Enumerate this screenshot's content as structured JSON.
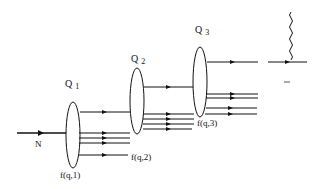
{
  "diagram": {
    "input": {
      "label": "N"
    },
    "stages": [
      {
        "name": "Q",
        "index": "1",
        "output_label": "f(q,1)"
      },
      {
        "name": "Q",
        "index": "2",
        "output_label": "f(q,2)"
      },
      {
        "name": "Q",
        "index": "3",
        "output_label": "f(q,3)"
      }
    ],
    "ellipsis": "..."
  },
  "colors": {
    "stroke": "#111111",
    "background": "#ffffff"
  }
}
